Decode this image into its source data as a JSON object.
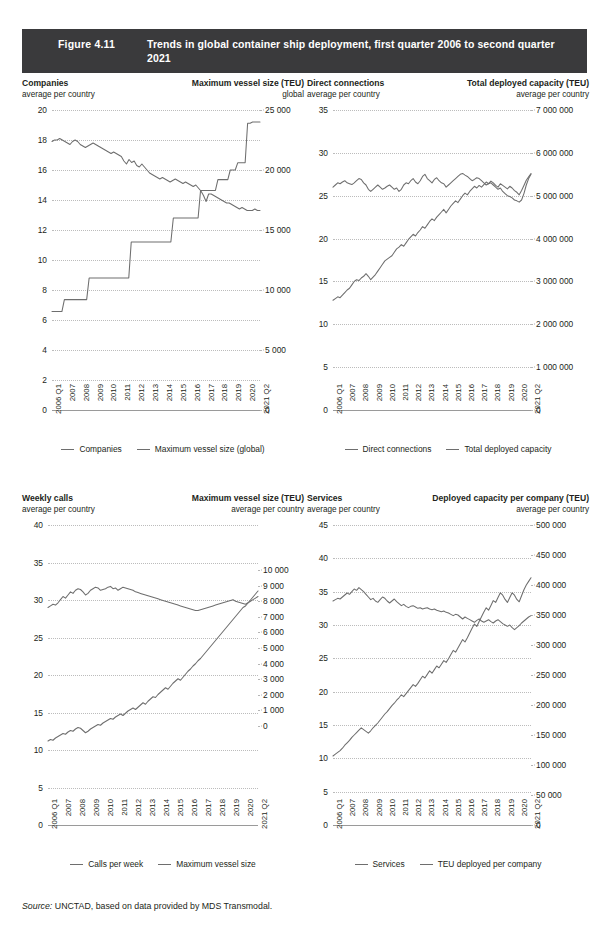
{
  "figure": {
    "number": "Figure 4.11",
    "title": "Trends in global container ship deployment, first quarter 2006 to second quarter 2021",
    "source_prefix": "Source:",
    "source_text": " UNCTAD, based on data provided by MDS Transmodal."
  },
  "x_categories": [
    "2006 Q1",
    "2007",
    "2008",
    "2009",
    "2010",
    "2011",
    "2012",
    "2013",
    "2014",
    "2015",
    "2016",
    "2017",
    "2018",
    "2019",
    "2020",
    "2021 Q2"
  ],
  "colors": {
    "line": "#6e6e6e",
    "grid": "#bcbcbc",
    "title_bar": "#3a3a3c",
    "text": "#231f20"
  },
  "chart_data": [
    {
      "id": "companies-max-vessel",
      "type": "line",
      "title": "",
      "left_title": "Companies",
      "left_subtitle": "average per country",
      "right_title": "Maximum vessel size (TEU)",
      "right_subtitle": "global",
      "xlabel": "",
      "ylabel": "Companies",
      "y2label": "Maximum vessel size (TEU)",
      "ylim": [
        0,
        20
      ],
      "y2lim": [
        0,
        25000
      ],
      "yticks": [
        0,
        2,
        4,
        6,
        8,
        10,
        12,
        14,
        16,
        18,
        20
      ],
      "y2ticks": [
        0,
        5000,
        10000,
        15000,
        20000,
        25000
      ],
      "y2ticklabels": [
        "0",
        "5 000",
        "10 000",
        "15 000",
        "20 000",
        "25 000"
      ],
      "grid": true,
      "legend": [
        "Companies",
        "Maximum vessel size (global)"
      ],
      "series": [
        {
          "name": "Companies",
          "axis": "left",
          "values": [
            17.9,
            18.0,
            18.0,
            18.1,
            18.0,
            17.9,
            17.8,
            17.7,
            17.9,
            18.0,
            17.9,
            17.7,
            17.6,
            17.5,
            17.6,
            17.7,
            17.8,
            17.7,
            17.6,
            17.5,
            17.4,
            17.3,
            17.2,
            17.1,
            17.2,
            17.1,
            17.0,
            16.9,
            16.6,
            16.4,
            16.7,
            16.5,
            16.6,
            16.3,
            16.2,
            16.4,
            16.2,
            16.0,
            15.8,
            15.7,
            15.6,
            15.5,
            15.4,
            15.5,
            15.4,
            15.3,
            15.2,
            15.3,
            15.4,
            15.3,
            15.2,
            15.1,
            15.2,
            15.1,
            15.0,
            14.9,
            15.0,
            14.8,
            14.6,
            14.3,
            13.9,
            14.4,
            14.4,
            14.3,
            14.2,
            14.1,
            14.0,
            13.9,
            13.8,
            13.8,
            13.7,
            13.6,
            13.5,
            13.4,
            13.5,
            13.4,
            13.3,
            13.3,
            13.3,
            13.4,
            13.3,
            13.3
          ]
        },
        {
          "name": "Maximum vessel size (global)",
          "axis": "right",
          "values": [
            8200,
            8200,
            8200,
            8200,
            8200,
            9200,
            9200,
            9200,
            9200,
            9200,
            9200,
            9200,
            9200,
            9200,
            9200,
            11000,
            11000,
            11000,
            11000,
            11000,
            11000,
            11000,
            11000,
            11000,
            11000,
            11000,
            11000,
            11000,
            11000,
            11000,
            11000,
            11000,
            14000,
            14000,
            14000,
            14000,
            14000,
            14000,
            14000,
            14000,
            14000,
            14000,
            14000,
            14000,
            14000,
            14000,
            14000,
            14000,
            14000,
            16000,
            16000,
            16000,
            16000,
            16000,
            16000,
            16000,
            16000,
            16000,
            16000,
            16000,
            18300,
            18300,
            18300,
            18300,
            18300,
            18300,
            18300,
            19200,
            19200,
            19200,
            19200,
            19200,
            20000,
            20000,
            20000,
            20600,
            20600,
            20600,
            20600,
            23900,
            23900,
            24000,
            24000,
            24000,
            24000
          ]
        }
      ]
    },
    {
      "id": "direct-connections-capacity",
      "type": "line",
      "title": "",
      "left_title": "Direct connections",
      "left_subtitle": "average per country",
      "right_title": "Total deployed capacity (TEU)",
      "right_subtitle": "average per country",
      "xlabel": "",
      "ylabel": "Direct connections",
      "y2label": "Total deployed capacity (TEU)",
      "ylim": [
        0,
        35
      ],
      "y2lim": [
        0,
        7000000
      ],
      "yticks": [
        0,
        5,
        10,
        15,
        20,
        25,
        30,
        35
      ],
      "y2ticks": [
        0,
        1000000,
        2000000,
        3000000,
        4000000,
        5000000,
        6000000,
        7000000
      ],
      "y2ticklabels": [
        "0",
        "1 000 000",
        "2 000 000",
        "3 000 000",
        "4 000 000",
        "5 000 000",
        "6 000 000",
        "7 000 000"
      ],
      "grid": true,
      "legend": [
        "Direct connections",
        "Total deployed capacity"
      ],
      "series": [
        {
          "name": "Direct connections",
          "axis": "left",
          "values": [
            12.8,
            13.0,
            13.2,
            13.1,
            13.4,
            13.7,
            14.0,
            14.2,
            14.6,
            15.0,
            15.2,
            15.1,
            15.4,
            15.6,
            15.9,
            15.6,
            15.2,
            15.5,
            15.8,
            16.2,
            16.6,
            17.0,
            17.4,
            17.6,
            17.8,
            18.0,
            18.4,
            18.8,
            19.0,
            19.3,
            19.1,
            19.5,
            19.9,
            20.2,
            20.5,
            20.3,
            20.7,
            21.0,
            21.4,
            21.2,
            21.6,
            22.0,
            22.3,
            22.1,
            22.5,
            22.8,
            23.1,
            23.4,
            23.0,
            23.4,
            23.8,
            24.1,
            24.4,
            24.2,
            24.6,
            25.0,
            25.3,
            25.1,
            25.5,
            25.8,
            26.1,
            25.9,
            26.2,
            26.0,
            26.3,
            26.6,
            26.4,
            26.7,
            26.5,
            26.2,
            26.0,
            26.4,
            26.2,
            26.0,
            25.8,
            26.1,
            25.9,
            25.6,
            25.4,
            25.1,
            25.6,
            26.2,
            26.8,
            27.2,
            27.6
          ]
        },
        {
          "name": "Total deployed capacity",
          "axis": "right",
          "values": [
            5200000,
            5250000,
            5300000,
            5280000,
            5320000,
            5350000,
            5300000,
            5280000,
            5260000,
            5300000,
            5350000,
            5400000,
            5380000,
            5300000,
            5250000,
            5150000,
            5100000,
            5150000,
            5200000,
            5250000,
            5200000,
            5150000,
            5180000,
            5220000,
            5250000,
            5200000,
            5150000,
            5180000,
            5100000,
            5150000,
            5250000,
            5300000,
            5280000,
            5350000,
            5400000,
            5320000,
            5280000,
            5350000,
            5450000,
            5500000,
            5400000,
            5350000,
            5300000,
            5380000,
            5420000,
            5350000,
            5300000,
            5280000,
            5200000,
            5250000,
            5300000,
            5350000,
            5400000,
            5450000,
            5500000,
            5520000,
            5480000,
            5450000,
            5400000,
            5350000,
            5380000,
            5420000,
            5400000,
            5350000,
            5300000,
            5250000,
            5280000,
            5300000,
            5250000,
            5200000,
            5150000,
            5180000,
            5100000,
            5050000,
            5000000,
            4980000,
            4950000,
            4900000,
            4880000,
            4850000,
            4900000,
            5050000,
            5250000,
            5400000,
            5500000
          ]
        }
      ]
    },
    {
      "id": "weekly-calls-max-vessel",
      "type": "line",
      "title": "",
      "left_title": "Weekly calls",
      "left_subtitle": "average per country",
      "right_title": "Maximum vessel size (TEU)",
      "right_subtitle": "average per country",
      "xlabel": "",
      "ylabel": "Weekly calls",
      "y2label": "Maximum vessel size (TEU)",
      "ylim": [
        0,
        40
      ],
      "y2lim": [
        0,
        10000
      ],
      "yticks": [
        0,
        5,
        10,
        15,
        20,
        25,
        30,
        35,
        40
      ],
      "y2ticks": [
        0,
        1000,
        2000,
        3000,
        4000,
        5000,
        6000,
        7000,
        8000,
        9000,
        10000
      ],
      "y2ticklabels": [
        "0",
        "1 000",
        "2 000",
        "3 000",
        "4 000",
        "5 000",
        "6 000",
        "7 000",
        "8 000",
        "9 000",
        "10 000"
      ],
      "y2_axis_top_value": 10000,
      "y2_axis_bottom_value": 0,
      "grid": true,
      "legend": [
        "Calls per week",
        "Maximum vessel size"
      ],
      "series": [
        {
          "name": "Calls per week",
          "axis": "left",
          "values": [
            11.2,
            11.4,
            11.3,
            11.6,
            11.8,
            12.0,
            12.2,
            12.1,
            12.4,
            12.6,
            12.5,
            12.8,
            13.0,
            12.9,
            12.6,
            12.3,
            12.5,
            12.8,
            13.0,
            13.2,
            13.4,
            13.3,
            13.6,
            13.8,
            14.0,
            14.2,
            14.1,
            14.4,
            14.6,
            14.8,
            14.6,
            14.9,
            15.2,
            15.4,
            15.6,
            15.4,
            15.7,
            16.0,
            16.3,
            16.1,
            16.5,
            16.8,
            17.1,
            17.0,
            17.4,
            17.7,
            18.0,
            18.3,
            18.1,
            18.5,
            18.9,
            19.2,
            19.5,
            19.3,
            19.7,
            20.1,
            20.5,
            20.8,
            21.2,
            21.5,
            21.9,
            22.2,
            22.6,
            23.0,
            23.4,
            23.8,
            24.2,
            24.6,
            25.0,
            25.4,
            25.8,
            26.2,
            26.6,
            27.0,
            27.4,
            27.8,
            28.2,
            28.6,
            29.0,
            29.2,
            29.6,
            30.0,
            30.4,
            30.8,
            31.2
          ]
        },
        {
          "name": "Maximum vessel size",
          "axis": "right",
          "values": [
            7600,
            7700,
            7800,
            7750,
            7900,
            8100,
            8300,
            8200,
            8400,
            8600,
            8500,
            8700,
            8800,
            8750,
            8600,
            8400,
            8500,
            8700,
            8800,
            8900,
            8850,
            8700,
            8750,
            8800,
            8900,
            8950,
            8800,
            8850,
            8700,
            8800,
            8900,
            8850,
            8800,
            8750,
            8700,
            8600,
            8550,
            8500,
            8450,
            8400,
            8350,
            8300,
            8250,
            8200,
            8150,
            8100,
            8050,
            8000,
            7950,
            7900,
            7850,
            7800,
            7750,
            7700,
            7650,
            7600,
            7550,
            7500,
            7450,
            7400,
            7400,
            7450,
            7500,
            7550,
            7600,
            7650,
            7700,
            7750,
            7800,
            7850,
            7900,
            7950,
            8000,
            8050,
            8100,
            8000,
            7950,
            7900,
            7850,
            7800,
            7900,
            8000,
            8100,
            8200,
            8300
          ]
        }
      ]
    },
    {
      "id": "services-capacity-per-company",
      "type": "line",
      "title": "",
      "left_title": "Services",
      "left_subtitle": "average per country",
      "right_title": "Deployed capacity per company (TEU)",
      "right_subtitle": "average per country",
      "xlabel": "",
      "ylabel": "Services",
      "y2label": "Deployed capacity per company (TEU)",
      "ylim": [
        0,
        45
      ],
      "y2lim": [
        0,
        500000
      ],
      "yticks": [
        0,
        5,
        10,
        15,
        20,
        25,
        30,
        35,
        40,
        45
      ],
      "y2ticks": [
        0,
        50000,
        100000,
        150000,
        200000,
        250000,
        300000,
        350000,
        400000,
        450000,
        500000
      ],
      "y2ticklabels": [
        "0",
        "50 000",
        "100 000",
        "150 000",
        "200 000",
        "250 000",
        "300 000",
        "350 000",
        "400 000",
        "450 000",
        "500 000"
      ],
      "grid": true,
      "legend": [
        "Services",
        "TEU deployed per company"
      ],
      "series": [
        {
          "name": "Services",
          "axis": "left",
          "values": [
            33.6,
            33.8,
            34.0,
            33.9,
            34.2,
            34.5,
            34.8,
            34.6,
            35.0,
            35.4,
            35.2,
            35.6,
            35.3,
            35.0,
            34.6,
            34.2,
            33.8,
            34.0,
            33.6,
            33.4,
            33.8,
            34.2,
            34.0,
            33.6,
            33.3,
            33.6,
            33.9,
            33.5,
            33.2,
            32.9,
            33.1,
            32.8,
            32.6,
            32.8,
            32.9,
            32.7,
            32.5,
            32.6,
            32.4,
            32.5,
            32.6,
            32.4,
            32.3,
            32.4,
            32.2,
            32.1,
            32.0,
            32.1,
            31.9,
            31.8,
            31.6,
            31.4,
            31.6,
            31.5,
            31.2,
            30.9,
            31.2,
            31.0,
            30.8,
            30.6,
            30.4,
            30.7,
            30.9,
            30.6,
            30.4,
            30.6,
            30.8,
            30.5,
            30.3,
            30.6,
            30.8,
            30.5,
            30.2,
            30.0,
            29.8,
            30.0,
            29.6,
            29.3,
            29.6,
            29.9,
            30.3,
            30.6,
            30.9,
            31.2,
            31.4
          ]
        },
        {
          "name": "TEU deployed per company",
          "axis": "right",
          "values": [
            115000,
            118000,
            121000,
            124000,
            128000,
            133000,
            137000,
            141000,
            146000,
            150000,
            154000,
            158000,
            162000,
            159000,
            156000,
            153000,
            157000,
            162000,
            166000,
            170000,
            175000,
            180000,
            185000,
            189000,
            194000,
            199000,
            203000,
            208000,
            212000,
            217000,
            214000,
            219000,
            224000,
            229000,
            234000,
            231000,
            236000,
            242000,
            248000,
            245000,
            251000,
            257000,
            253000,
            259000,
            265000,
            262000,
            268000,
            274000,
            271000,
            277000,
            284000,
            291000,
            288000,
            295000,
            302000,
            309000,
            305000,
            312000,
            320000,
            328000,
            335000,
            331000,
            339000,
            347000,
            355000,
            362000,
            358000,
            366000,
            374000,
            371000,
            379000,
            387000,
            383000,
            376000,
            371000,
            379000,
            387000,
            383000,
            376000,
            372000,
            382000,
            392000,
            400000,
            406000,
            412000
          ]
        }
      ]
    }
  ]
}
